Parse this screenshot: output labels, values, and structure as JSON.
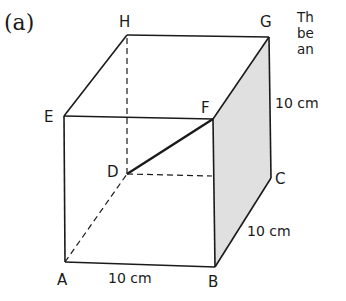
{
  "figure": {
    "part_label": "(a)",
    "side_text_lines": [
      "Th",
      "be",
      "an"
    ]
  },
  "diagram": {
    "type": "cuboid",
    "vertices": {
      "A": {
        "label": "A",
        "x": 65,
        "y": 262
      },
      "B": {
        "label": "B",
        "x": 215,
        "y": 267
      },
      "C": {
        "label": "C",
        "x": 271,
        "y": 178
      },
      "D": {
        "label": "D",
        "x": 127,
        "y": 174
      },
      "E": {
        "label": "E",
        "x": 64,
        "y": 116
      },
      "F": {
        "label": "F",
        "x": 213,
        "y": 119
      },
      "G": {
        "label": "G",
        "x": 269,
        "y": 37
      },
      "H": {
        "label": "H",
        "x": 127,
        "y": 35
      }
    },
    "dimensions": [
      {
        "edge": "AB",
        "text": "10 cm"
      },
      {
        "edge": "BC",
        "text": "10 cm"
      },
      {
        "edge": "CG",
        "text": "10 cm"
      }
    ],
    "highlighted_segment": "DF",
    "shaded_face": "BCGF",
    "colors": {
      "line": "#1a1a1a",
      "shade": "#e0e0e0"
    }
  }
}
